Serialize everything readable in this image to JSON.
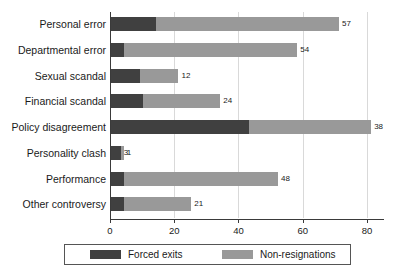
{
  "chart_data": {
    "type": "bar",
    "orientation": "horizontal",
    "stacked": true,
    "title": "",
    "xlabel": "",
    "ylabel": "",
    "xlim": [
      0,
      85
    ],
    "ticks": [
      0,
      20,
      40,
      60,
      80
    ],
    "tick_labels": [
      "0",
      "20",
      "40",
      "60",
      "80"
    ],
    "grid": true,
    "legend_position": "bottom",
    "categories": [
      "Personal error",
      "Departmental error",
      "Sexual scandal",
      "Financial scandal",
      "Policy disagreement",
      "Personality clash",
      "Performance",
      "Other controversy"
    ],
    "series": [
      {
        "name": "Forced exits",
        "color": "#404040",
        "values": [
          14,
          4,
          9,
          10,
          43,
          3,
          4,
          4
        ]
      },
      {
        "name": "Non-resignations",
        "color": "#999999",
        "values": [
          57,
          54,
          12,
          24,
          38,
          1,
          48,
          21
        ]
      }
    ],
    "totals": [
      71,
      58,
      21,
      34,
      81,
      4,
      52,
      25
    ]
  },
  "legend": {
    "entries": [
      {
        "label": "Forced exits",
        "color": "#404040"
      },
      {
        "label": "Non-resignations",
        "color": "#999999"
      }
    ]
  },
  "caption": {
    "text": ""
  }
}
